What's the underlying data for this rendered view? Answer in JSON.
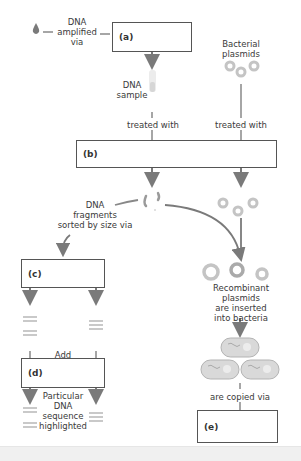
{
  "diagram": {
    "colors": {
      "arrow": "#7a7a7a",
      "box_border": "#555555",
      "plasmid": "#bdbdbd",
      "bacteria_fill": "#d6d6d6"
    },
    "labels": {
      "dna_amplified_via": "DNA\namplified\nvia",
      "dna_sample": "DNA\nsample",
      "bacterial_plasmids": "Bacterial\nplasmids",
      "treated_with_left": "treated with",
      "treated_with_right": "treated with",
      "dna_fragments": "DNA\nfragments\nsorted by size via",
      "recombinant": "Recombinant plasmids\nare inserted\ninto bacteria",
      "add": "Add",
      "particular": "Particular\nDNA\nsequence\nhighlighted",
      "are_copied_via": "are copied via"
    },
    "boxes": {
      "a": "(a)",
      "b": "(b)",
      "c": "(c)",
      "d": "(d)",
      "e": "(e)"
    },
    "icons": [
      "drop-icon",
      "test-tube-icon",
      "plasmid-icon",
      "dna-fragment-icon",
      "bacteria-icon",
      "gel-band-icon"
    ]
  }
}
